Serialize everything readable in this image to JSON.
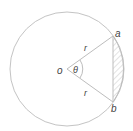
{
  "diagram": {
    "labels": {
      "center": "o",
      "angle": "θ",
      "radius_top": "r",
      "radius_bottom": "r",
      "point_a": "a",
      "point_b": "b"
    },
    "colors": {
      "stroke": "#bdbdbd",
      "text": "#444444",
      "hatch": "#c8c8c8"
    }
  }
}
